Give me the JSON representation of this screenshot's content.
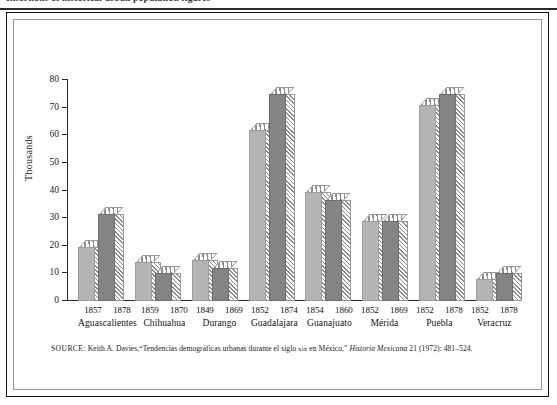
{
  "top_caption": "Insertions of historical urban population figures",
  "figure": {
    "y_axis_title": "Thousands",
    "y_ticks": [
      "0",
      "10",
      "20",
      "30",
      "40",
      "50",
      "60",
      "70",
      "80"
    ],
    "source": {
      "label": "SOURCE:",
      "author": "Keith A. Davies,",
      "article_open": "“Tendencias demográficas urbanas durante el siglo ",
      "century": "xix",
      "article_close": " en México,” ",
      "journal": "Historia Mexicana",
      "citation": " 21 (1972): 481–524."
    }
  },
  "chart_data": {
    "type": "bar",
    "title": "",
    "subtitle": "",
    "xlabel": "",
    "ylabel": "Thousands",
    "ylim": [
      0,
      80
    ],
    "ytick_step": 10,
    "grid": false,
    "legend": "none",
    "categories": [
      "Aguascalientes",
      "Chihuahua",
      "Durango",
      "Guadalajara",
      "Guanajuato",
      "Mérida",
      "Puebla",
      "Veracruz"
    ],
    "series": [
      {
        "name": "earlier year",
        "shade": "light",
        "color": "#b4b4b4",
        "year_labels": [
          "1857",
          "1859",
          "1849",
          "1852",
          "1854",
          "1852",
          "1852",
          "1852"
        ],
        "values": [
          19.5,
          14,
          15,
          62,
          39.5,
          29,
          71,
          8
        ]
      },
      {
        "name": "later year",
        "shade": "dark",
        "color": "#848484",
        "year_labels": [
          "1878",
          "1870",
          "1869",
          "1874",
          "1860",
          "1869",
          "1878",
          "1878"
        ],
        "values": [
          31.5,
          10,
          12,
          75,
          36.5,
          29,
          75,
          10
        ]
      }
    ]
  },
  "colors": {
    "bar_light": "#b4b4b4",
    "bar_dark": "#848484",
    "hatch": "#8d8d8d",
    "axis": "#2b2b2b",
    "frame": "#111111",
    "inner_frame": "#9a9a9a"
  }
}
